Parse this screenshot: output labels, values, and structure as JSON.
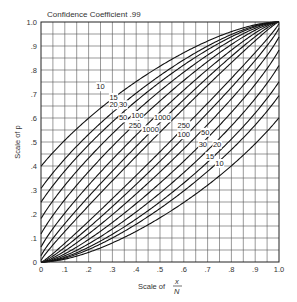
{
  "chart_data": {
    "type": "line",
    "title": "Confidence Coefficient .99",
    "xlabel": "Scale of x/N",
    "xlabel_parts": {
      "prefix": "Scale of",
      "num": "x",
      "den": "N"
    },
    "ylabel": "Scale of p",
    "xlim": [
      0,
      1
    ],
    "ylim": [
      0,
      1
    ],
    "grid": true,
    "grid_step": 0.05,
    "confidence": 0.99,
    "z": 2.576,
    "x_ticks": [
      "0",
      ".1",
      ".2",
      ".3",
      ".4",
      ".5",
      ".6",
      ".7",
      ".8",
      ".9",
      "1.0"
    ],
    "y_ticks": [
      "0",
      ".1",
      ".2",
      ".3",
      ".4",
      ".5",
      ".6",
      ".7",
      ".8",
      ".9",
      "1.0"
    ],
    "sample_sizes": [
      10,
      15,
      20,
      30,
      50,
      100,
      250,
      1000
    ],
    "series": [
      {
        "name": "upper n=10",
        "n": 10,
        "bound": "upper"
      },
      {
        "name": "upper n=15",
        "n": 15,
        "bound": "upper"
      },
      {
        "name": "upper n=20",
        "n": 20,
        "bound": "upper"
      },
      {
        "name": "upper n=30",
        "n": 30,
        "bound": "upper"
      },
      {
        "name": "upper n=50",
        "n": 50,
        "bound": "upper"
      },
      {
        "name": "upper n=100",
        "n": 100,
        "bound": "upper"
      },
      {
        "name": "upper n=250",
        "n": 250,
        "bound": "upper"
      },
      {
        "name": "upper n=1000",
        "n": 1000,
        "bound": "upper"
      },
      {
        "name": "lower n=10",
        "n": 10,
        "bound": "lower"
      },
      {
        "name": "lower n=15",
        "n": 15,
        "bound": "lower"
      },
      {
        "name": "lower n=20",
        "n": 20,
        "bound": "lower"
      },
      {
        "name": "lower n=30",
        "n": 30,
        "bound": "lower"
      },
      {
        "name": "lower n=50",
        "n": 50,
        "bound": "lower"
      },
      {
        "name": "lower n=100",
        "n": 100,
        "bound": "lower"
      },
      {
        "name": "lower n=250",
        "n": 250,
        "bound": "lower"
      },
      {
        "name": "lower n=1000",
        "n": 1000,
        "bound": "lower"
      }
    ],
    "annotations": [
      {
        "text": "10",
        "x": 0.25,
        "y": 0.72
      },
      {
        "text": "15",
        "x": 0.305,
        "y": 0.675
      },
      {
        "text": "20",
        "x": 0.305,
        "y": 0.645
      },
      {
        "text": "30",
        "x": 0.345,
        "y": 0.645
      },
      {
        "text": "50",
        "x": 0.345,
        "y": 0.59
      },
      {
        "text": "100",
        "x": 0.405,
        "y": 0.6
      },
      {
        "text": "250",
        "x": 0.395,
        "y": 0.56
      },
      {
        "text": "1000",
        "x": 0.51,
        "y": 0.59
      },
      {
        "text": "1000",
        "x": 0.46,
        "y": 0.54
      },
      {
        "text": "250",
        "x": 0.6,
        "y": 0.56
      },
      {
        "text": "100",
        "x": 0.6,
        "y": 0.52
      },
      {
        "text": "50",
        "x": 0.69,
        "y": 0.53
      },
      {
        "text": "30",
        "x": 0.68,
        "y": 0.48
      },
      {
        "text": "20",
        "x": 0.74,
        "y": 0.48
      },
      {
        "text": "15",
        "x": 0.71,
        "y": 0.43
      },
      {
        "text": "10",
        "x": 0.75,
        "y": 0.4
      }
    ]
  }
}
